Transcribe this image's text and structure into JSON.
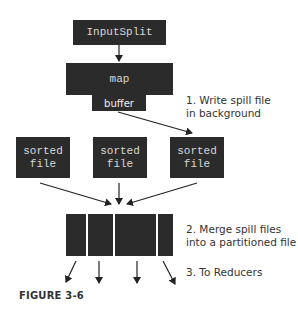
{
  "diagram": {
    "input_split": "InputSplit",
    "map": "map",
    "buffer": "buffer",
    "sorted_files": [
      {
        "line1": "sorted",
        "line2": "file"
      },
      {
        "line1": "sorted",
        "line2": "file"
      },
      {
        "line1": "sorted",
        "line2": "file"
      }
    ],
    "partitioned_file_segments": 4,
    "notes": {
      "step1_line1": "1. Write spill file",
      "step1_line2": "in background",
      "step2_line1": "2. Merge spill files",
      "step2_line2": "into a partitioned file",
      "step3": "3. To Reducers"
    },
    "caption": "FIGURE 3-6"
  },
  "colors": {
    "box_fill": "#2b2b2b",
    "box_text": "#d8d8d8",
    "arrow": "#222222",
    "background": "#ffffff"
  }
}
